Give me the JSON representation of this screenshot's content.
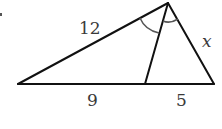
{
  "diagram": {
    "type": "triangle-with-angle-bisector",
    "vertices": {
      "left": {
        "x": 18,
        "y": 84
      },
      "apex": {
        "x": 168,
        "y": 3
      },
      "foot": {
        "x": 145,
        "y": 84
      },
      "right": {
        "x": 214,
        "y": 84
      }
    },
    "labels": {
      "left_side": "12",
      "right_side": "x",
      "base_left_segment": "9",
      "base_right_segment": "5"
    },
    "colors": {
      "stroke": "#111111",
      "arc": "#555555",
      "text": "#3a3a3a"
    }
  }
}
